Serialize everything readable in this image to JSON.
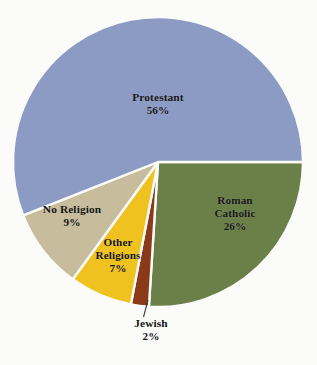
{
  "chart_data": {
    "type": "pie",
    "title": "",
    "subtitle": "",
    "xlabel": "",
    "ylabel": "",
    "legend_position": "none",
    "grid": false,
    "value_unit": "%",
    "categories": [
      "Protestant",
      "Roman Catholic",
      "Jewish",
      "Other Religions",
      "No Religion"
    ],
    "values": [
      56,
      26,
      2,
      7,
      9
    ],
    "slices": [
      {
        "label": "Protestant",
        "label_lines": [
          "Protestant"
        ],
        "value": 56,
        "value_text": "56%",
        "color": "#8c9bc4",
        "label_placement": "inside"
      },
      {
        "label": "Roman Catholic",
        "label_lines": [
          "Roman",
          "Catholic"
        ],
        "value": 26,
        "value_text": "26%",
        "color": "#6b8049",
        "label_placement": "inside"
      },
      {
        "label": "Jewish",
        "label_lines": [
          "Jewish"
        ],
        "value": 2,
        "value_text": "2%",
        "color": "#8a3a19",
        "label_placement": "outside-leader"
      },
      {
        "label": "Other Religions",
        "label_lines": [
          "Other",
          "Religions"
        ],
        "value": 7,
        "value_text": "7%",
        "color": "#f0c220",
        "label_placement": "inside"
      },
      {
        "label": "No Religion",
        "label_lines": [
          "No Religion"
        ],
        "value": 9,
        "value_text": "9%",
        "color": "#c7bc9b",
        "label_placement": "inside"
      }
    ],
    "colors": {
      "protestant": "#8c9bc4",
      "roman_catholic": "#6b8049",
      "jewish": "#8a3a19",
      "other_religions": "#f0c220",
      "no_religion": "#c7bc9b",
      "background": "#fbfbfa",
      "slice_separator": "#fbfbfa",
      "label_text": "#141414",
      "leader_line": "#3a3a3a"
    }
  }
}
